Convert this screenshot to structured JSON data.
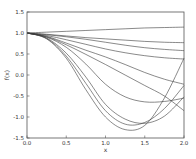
{
  "chart_data": {
    "type": "line",
    "title": "",
    "xlabel": "x",
    "ylabel": "f(x)",
    "xlim": [
      0.0,
      2.0
    ],
    "ylim": [
      -1.5,
      1.5
    ],
    "grid": false,
    "legend": null,
    "x_ticks": [
      "0.0",
      "0.5",
      "1.0",
      "1.5",
      "2.0"
    ],
    "y_ticks": [
      "1.5",
      "1.0",
      "0.5",
      "0.0",
      "-0.5",
      "-1.0",
      "-1.5"
    ],
    "x": [
      0.0,
      0.25,
      0.5,
      0.75,
      1.0,
      1.25,
      1.5,
      1.75,
      2.0
    ],
    "series": [
      {
        "name": "curve-1",
        "values": [
          1.0,
          1.02,
          1.04,
          1.06,
          1.08,
          1.1,
          1.12,
          1.13,
          1.14
        ]
      },
      {
        "name": "curve-2",
        "values": [
          1.0,
          0.97,
          0.93,
          0.89,
          0.86,
          0.83,
          0.8,
          0.78,
          0.77
        ]
      },
      {
        "name": "curve-3",
        "values": [
          1.0,
          0.96,
          0.91,
          0.85,
          0.78,
          0.71,
          0.65,
          0.61,
          0.58
        ]
      },
      {
        "name": "curve-4",
        "values": [
          1.0,
          0.94,
          0.84,
          0.73,
          0.62,
          0.53,
          0.46,
          0.41,
          0.38
        ]
      },
      {
        "name": "curve-5",
        "values": [
          1.0,
          0.92,
          0.76,
          0.59,
          0.43,
          0.25,
          0.06,
          -0.1,
          -0.22
        ]
      },
      {
        "name": "curve-6",
        "values": [
          1.0,
          0.91,
          0.72,
          0.49,
          0.25,
          0.0,
          -0.25,
          -0.5,
          -0.85
        ]
      },
      {
        "name": "curve-7",
        "values": [
          1.0,
          0.9,
          0.66,
          0.26,
          -0.22,
          -0.52,
          -0.64,
          -0.63,
          -0.55
        ]
      },
      {
        "name": "curve-8",
        "values": [
          1.0,
          0.88,
          0.52,
          -0.05,
          -0.7,
          -1.05,
          -1.15,
          -0.98,
          -0.52
        ]
      },
      {
        "name": "curve-9",
        "values": [
          1.0,
          0.87,
          0.45,
          -0.2,
          -0.85,
          -1.17,
          -1.13,
          -0.8,
          -0.25
        ]
      },
      {
        "name": "curve-10",
        "values": [
          1.0,
          0.86,
          0.4,
          -0.35,
          -1.0,
          -1.3,
          -1.2,
          -0.55,
          0.4
        ]
      }
    ]
  },
  "colors": {
    "line": "#3a3a3a",
    "axis": "#555555",
    "background": "#ffffff"
  }
}
